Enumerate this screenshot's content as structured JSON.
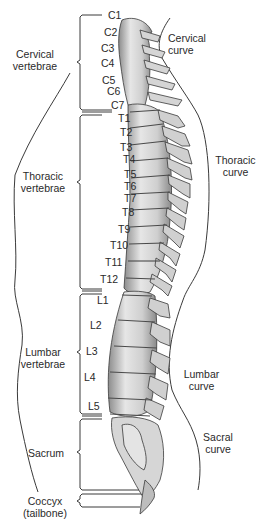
{
  "groups": [
    {
      "label_line1": "Cervical",
      "label_line2": "vertebrae"
    },
    {
      "label_line1": "Thoracic",
      "label_line2": "vertebrae"
    },
    {
      "label_line1": "Lumbar",
      "label_line2": "vertebrae"
    },
    {
      "label_line1": "Sacrum",
      "label_line2": ""
    },
    {
      "label_line1": "Coccyx",
      "label_line2": "(tailbone)"
    }
  ],
  "vertebrae": [
    "C1",
    "C2",
    "C3",
    "C4",
    "C5",
    "C6",
    "C7",
    "T1",
    "T2",
    "T3",
    "T4",
    "T5",
    "T6",
    "T7",
    "T8",
    "T9",
    "T10",
    "T11",
    "T12",
    "L1",
    "L2",
    "L3",
    "L4",
    "L5"
  ],
  "curves": [
    {
      "label_line1": "Cervical",
      "label_line2": "curve"
    },
    {
      "label_line1": "Thoracic",
      "label_line2": "curve"
    },
    {
      "label_line1": "Lumbar",
      "label_line2": "curve"
    },
    {
      "label_line1": "Sacral",
      "label_line2": "curve"
    }
  ],
  "colors": {
    "bone": "#d9d9d9",
    "bone_shade": "#9a9a9a",
    "outline": "#3a3a3a",
    "text": "#2a2a2a"
  }
}
